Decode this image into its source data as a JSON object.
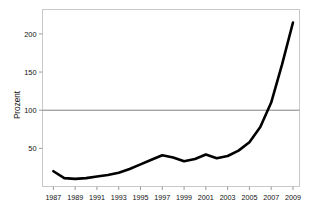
{
  "chart_data": {
    "type": "line",
    "title": "",
    "subtitle": "",
    "xlabel": "",
    "ylabel": "Prozent",
    "xlim": [
      1986,
      2009.6
    ],
    "ylim": [
      0,
      232
    ],
    "grid": false,
    "legend": false,
    "legend_position": "none",
    "reference_lines": [
      {
        "axis": "y",
        "value": 100,
        "color": "#808080",
        "label": ""
      }
    ],
    "y_ticks": [
      50,
      100,
      150,
      200
    ],
    "y_tick_labels": [
      "50",
      "100",
      "150",
      "200"
    ],
    "x_ticks": [
      1987,
      1989,
      1991,
      1993,
      1995,
      1997,
      1999,
      2001,
      2003,
      2005,
      2007,
      2009
    ],
    "x_tick_labels": [
      "1987",
      "1989",
      "1991",
      "1993",
      "1995",
      "1997",
      "1999",
      "2001",
      "2003",
      "2005",
      "2007",
      "2009"
    ],
    "series": [
      {
        "name": "Prozent",
        "color": "#000000",
        "line_width": 2.6,
        "x": [
          1987,
          1988,
          1989,
          1990,
          1991,
          1992,
          1993,
          1994,
          1995,
          1996,
          1997,
          1998,
          1999,
          2000,
          2001,
          2002,
          2003,
          2004,
          2005,
          2006,
          2007,
          2008,
          2009
        ],
        "values": [
          20,
          11,
          10,
          11,
          13,
          15,
          18,
          23,
          29,
          35,
          41,
          38,
          33,
          36,
          42,
          37,
          40,
          47,
          58,
          78,
          110,
          160,
          215
        ]
      }
    ]
  },
  "figure": {
    "background_color": "#ffffff",
    "frame_color": "#c9c9c9",
    "axis_color": "#b4b4b4",
    "tick_color": "#9a9a9a",
    "line_color": "#000000",
    "reference_line_color": "#808080"
  }
}
